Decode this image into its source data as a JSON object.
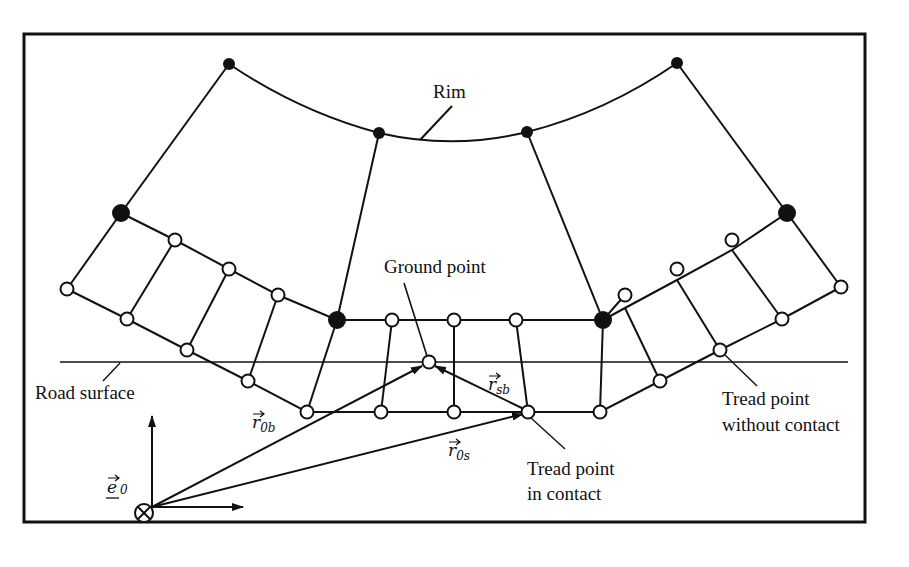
{
  "diagram": {
    "labels": {
      "rim": "Rim",
      "ground_point": "Ground point",
      "road_surface": "Road surface",
      "tread_in_contact_line1": "Tread point",
      "tread_in_contact_line2": "in contact",
      "tread_without_contact_line1": "Tread point",
      "tread_without_contact_line2": "without contact"
    },
    "vectors": {
      "r0b": {
        "base": "r",
        "sub": "0b"
      },
      "r0s": {
        "base": "r",
        "sub": "0s"
      },
      "rsb": {
        "base": "r",
        "sub": "sb"
      },
      "e0": {
        "base": "e",
        "sub": "0"
      }
    },
    "origin_symbol": "⊗",
    "node_types": [
      "rim-node",
      "belt-node",
      "tread-node",
      "ground-point"
    ],
    "colors": {
      "ink": "#111111",
      "background": "#ffffff"
    }
  }
}
